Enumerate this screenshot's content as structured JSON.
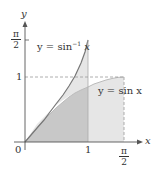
{
  "figure": {
    "axes": {
      "x_label": "x",
      "y_label": "y",
      "origin_label": "0"
    },
    "x_ticks": [
      {
        "label": "1",
        "value": 1
      },
      {
        "label_num": "π",
        "label_den": "2",
        "value": 1.5708
      }
    ],
    "y_ticks": [
      {
        "label": "1",
        "value": 1
      },
      {
        "label_num": "π",
        "label_den": "2",
        "value": 1.5708
      }
    ],
    "curves": [
      {
        "name": "arcsin",
        "label": "y = sin⁻¹ x",
        "label_prefix": "y = sin",
        "label_sup": "−1",
        "label_suffix": " x"
      },
      {
        "name": "sin",
        "label": "y = sin x"
      }
    ],
    "colors": {
      "axis": "#555555",
      "curve": "#777777",
      "dark_region": "#c8c8c8",
      "light_region": "#e6e6e6",
      "dashed": "#999999"
    }
  }
}
